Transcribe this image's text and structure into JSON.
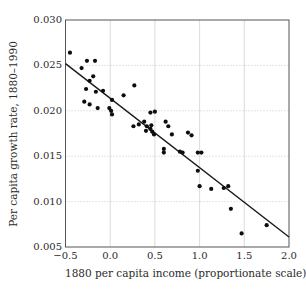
{
  "figure": {
    "background": "#ffffff"
  },
  "chart_data": {
    "type": "scatter",
    "title": "",
    "xlabel": "1880 per capita income (proportionate scale)",
    "ylabel": "Per capita growth rate, 1880–1990",
    "xlim": [
      -0.5,
      2.0
    ],
    "ylim": [
      0.005,
      0.03
    ],
    "xticks": [
      -0.5,
      0.0,
      0.5,
      1.0,
      1.5,
      2.0
    ],
    "xtick_labels": [
      "−0.5",
      "0.0",
      "0.5",
      "1.0",
      "1.5",
      "2.0"
    ],
    "yticks": [
      0.005,
      0.01,
      0.015,
      0.02,
      0.025,
      0.03
    ],
    "ytick_labels": [
      "0.005",
      "0.010",
      "0.015",
      "0.020",
      "0.025",
      "0.030"
    ],
    "legend_position": "none",
    "grid": {
      "vertical": "solid",
      "horizontal": "dotted"
    },
    "trend_line": {
      "x": [
        -0.5,
        2.0
      ],
      "y": [
        0.0252,
        0.0061
      ]
    },
    "points": [
      [
        -0.45,
        0.0264
      ],
      [
        -0.26,
        0.0255
      ],
      [
        -0.17,
        0.0255
      ],
      [
        -0.32,
        0.0247
      ],
      [
        -0.19,
        0.0238
      ],
      [
        -0.23,
        0.0233
      ],
      [
        -0.27,
        0.0224
      ],
      [
        -0.16,
        0.0221
      ],
      [
        -0.08,
        0.0222
      ],
      [
        -0.29,
        0.021
      ],
      [
        -0.23,
        0.0207
      ],
      [
        -0.14,
        0.0203
      ],
      [
        -0.01,
        0.0203
      ],
      [
        0.01,
        0.02
      ],
      [
        0.02,
        0.0196
      ],
      [
        0.02,
        0.0212
      ],
      [
        0.15,
        0.0217
      ],
      [
        0.27,
        0.0228
      ],
      [
        0.26,
        0.0183
      ],
      [
        0.32,
        0.0185
      ],
      [
        0.45,
        0.0198
      ],
      [
        0.38,
        0.0188
      ],
      [
        0.41,
        0.0183
      ],
      [
        0.46,
        0.0184
      ],
      [
        0.45,
        0.018
      ],
      [
        0.4,
        0.0178
      ],
      [
        0.47,
        0.0177
      ],
      [
        0.5,
        0.0199
      ],
      [
        0.49,
        0.0174
      ],
      [
        0.62,
        0.0188
      ],
      [
        0.65,
        0.0183
      ],
      [
        0.69,
        0.0174
      ],
      [
        0.6,
        0.0158
      ],
      [
        0.6,
        0.0154
      ],
      [
        0.78,
        0.0155
      ],
      [
        0.81,
        0.0154
      ],
      [
        0.87,
        0.0176
      ],
      [
        0.91,
        0.0173
      ],
      [
        0.98,
        0.0154
      ],
      [
        1.02,
        0.0154
      ],
      [
        0.98,
        0.0134
      ],
      [
        1.0,
        0.0117
      ],
      [
        1.13,
        0.0114
      ],
      [
        1.27,
        0.0115
      ],
      [
        1.32,
        0.0117
      ],
      [
        1.35,
        0.0092
      ],
      [
        1.47,
        0.0065
      ],
      [
        1.75,
        0.0074
      ]
    ],
    "colors": {
      "point": "#0d0d0d",
      "trend": "#1a1a1a",
      "frame": "#555555",
      "grid_vertical": "#d2d2d2",
      "grid_horizontal": "#bdbdbd",
      "text": "#2b2b2b"
    }
  }
}
